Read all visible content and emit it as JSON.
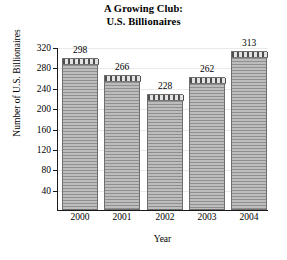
{
  "chart_data": {
    "type": "bar",
    "title": "A Growing Club: U.S. Billionaires",
    "title_lines": [
      "A Growing Club:",
      "U.S. Billionaires"
    ],
    "xlabel": "Year",
    "ylabel": "Number of U.S. Billionaires",
    "categories": [
      "2000",
      "2001",
      "2002",
      "2003",
      "2004"
    ],
    "values": [
      298,
      266,
      228,
      262,
      313
    ],
    "data_labels": [
      "298",
      "266",
      "228",
      "262",
      "313"
    ],
    "ylim": [
      0,
      320
    ],
    "yticks": [
      40,
      80,
      120,
      160,
      200,
      240,
      280,
      320
    ],
    "ytick_labels": [
      "40",
      "80",
      "120",
      "160",
      "200",
      "240",
      "280",
      "320"
    ],
    "grid": true,
    "legend": false,
    "series": [
      {
        "name": "U.S. Billionaires",
        "values": [
          298,
          266,
          228,
          262,
          313
        ]
      }
    ],
    "colors": {
      "bar_fill": "#a8a8a8",
      "bar_stripe": "#8f8f8f",
      "bar_edge": "#6e6e6e",
      "bar_cap": "#d6d6d6",
      "axis": "#1a1a1a",
      "gridline": "#e9e9e9",
      "text": "#000000",
      "background": "#ffffff"
    }
  }
}
